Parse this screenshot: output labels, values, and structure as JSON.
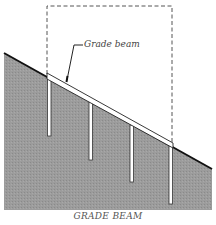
{
  "diagram": {
    "caption": "GRADE BEAM",
    "callout_label": "Grade beam",
    "elements": [
      "sloped ground",
      "grade beam",
      "piers",
      "dashed building outline"
    ],
    "pier_count": 4,
    "colors": {
      "ground_fill": "#9a9a9a",
      "ground_line": "#111111",
      "beam_fill": "#ffffff",
      "outline": "#333333",
      "dashed_outline": "#555555"
    }
  }
}
